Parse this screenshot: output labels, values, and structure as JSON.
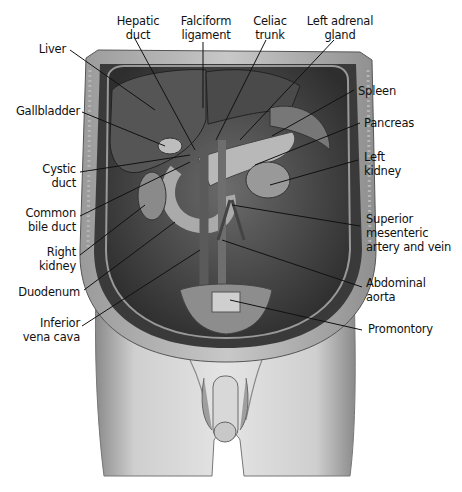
{
  "figure": {
    "labels_top": [
      {
        "id": "hepatic-duct",
        "text": "Hepatic\nduct"
      },
      {
        "id": "falciform-ligament",
        "text": "Falciform\nligament"
      },
      {
        "id": "celiac-trunk",
        "text": "Celiac\ntrunk"
      },
      {
        "id": "left-adrenal-gland",
        "text": "Left adrenal\ngland"
      }
    ],
    "labels_left": [
      {
        "id": "liver",
        "text": "Liver"
      },
      {
        "id": "gallbladder",
        "text": "Gallbladder"
      },
      {
        "id": "cystic-duct",
        "text": "Cystic\nduct"
      },
      {
        "id": "common-bile-duct",
        "text": "Common\nbile duct"
      },
      {
        "id": "right-kidney",
        "text": "Right\nkidney"
      },
      {
        "id": "duodenum",
        "text": "Duodenum"
      },
      {
        "id": "inferior-vena-cava",
        "text": "Inferior\nvena cava"
      }
    ],
    "labels_right": [
      {
        "id": "spleen",
        "text": "Spleen"
      },
      {
        "id": "pancreas",
        "text": "Pancreas"
      },
      {
        "id": "left-kidney",
        "text": "Left\nkidney"
      },
      {
        "id": "superior-mesenteric",
        "text": "Superior\nmesenteric\nartery and vein"
      },
      {
        "id": "abdominal-aorta",
        "text": "Abdominal\naorta"
      },
      {
        "id": "promontory",
        "text": "Promontory"
      }
    ]
  }
}
